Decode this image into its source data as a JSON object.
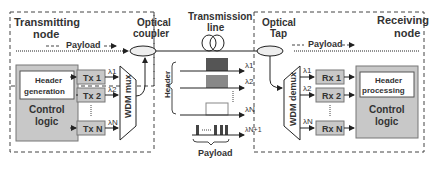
{
  "transmitter": {
    "title_line1": "Transmitting",
    "title_line2": "node",
    "payload_label": "Payload",
    "header_generation_line1": "Header",
    "header_generation_line2": "generation",
    "control_logic_line1": "Control",
    "control_logic_line2": "logic",
    "tx": [
      "Tx 1",
      "Tx 2",
      "Tx N"
    ],
    "mux_label": "WDM mux",
    "lambdas": [
      "λ1",
      "λ2",
      "λN"
    ]
  },
  "coupler": {
    "line1": "Optical",
    "line2": "coupler"
  },
  "transmission": {
    "line1": "Transmission",
    "line2": "line"
  },
  "spectrum": {
    "header_label": "Header",
    "payload_label": "Payload",
    "lambdas": [
      "λ1",
      "λ2",
      "λN",
      "λN+1"
    ]
  },
  "tap": {
    "line1": "Optical",
    "line2": "Tap"
  },
  "receiver": {
    "title_line1": "Receiving",
    "title_line2": "node",
    "payload_label": "Payload",
    "demux_label": "WDM demux",
    "rx": [
      "Rx 1",
      "Rx 2",
      "Rx N"
    ],
    "header_processing_line1": "Header",
    "header_processing_line2": "processing",
    "control_logic_line1": "Control",
    "control_logic_line2": "logic",
    "lambdas": [
      "λ1",
      "λ2",
      "λN"
    ]
  },
  "colors": {
    "box_fill": "#c8c8c8",
    "box_stroke": "#777777",
    "dark_bar": "#555555",
    "mid_bar": "#888888"
  }
}
